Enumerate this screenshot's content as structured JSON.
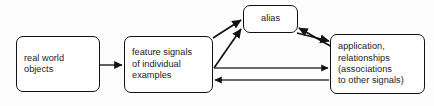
{
  "diagram": {
    "background_color": "#fdfdfd",
    "stroke_color": "#121212",
    "text_color": "#1a1a1a",
    "nodes": [
      {
        "id": "real-world-objects",
        "lines": [
          "real world",
          "objects"
        ],
        "align": "left"
      },
      {
        "id": "feature-signals",
        "lines": [
          "feature signals",
          "of individual",
          "examples"
        ],
        "align": "left"
      },
      {
        "id": "alias",
        "lines": [
          "alias"
        ],
        "align": "center"
      },
      {
        "id": "application",
        "lines": [
          "application,",
          "relationships",
          "(associations",
          "to other signals)"
        ],
        "align": "left"
      }
    ],
    "edges": [
      {
        "id": "objects-to-features",
        "from": "real-world-objects",
        "to": "feature-signals",
        "direction": "forward"
      },
      {
        "id": "features-to-alias-upper",
        "from": "feature-signals",
        "to": "alias",
        "direction": "forward"
      },
      {
        "id": "features-to-alias-lower",
        "from": "feature-signals",
        "to": "alias",
        "direction": "forward"
      },
      {
        "id": "application-to-alias",
        "from": "application",
        "to": "alias",
        "direction": "forward"
      },
      {
        "id": "alias-to-application",
        "from": "alias",
        "to": "application",
        "direction": "forward"
      },
      {
        "id": "features-to-application",
        "from": "feature-signals",
        "to": "application",
        "direction": "forward"
      },
      {
        "id": "application-to-features",
        "from": "application",
        "to": "feature-signals",
        "direction": "forward"
      }
    ]
  }
}
